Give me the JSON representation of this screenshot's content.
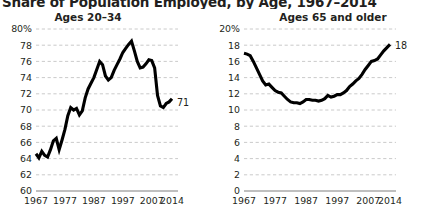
{
  "title": "Share of Population Employed, by Age, 1967–2014",
  "charts": [
    {
      "id": "ages-20-34",
      "title": "Ages 20–34",
      "end_label": "71"
    },
    {
      "id": "ages-65-older",
      "title": "Ages 65 and older",
      "end_label": "18"
    }
  ],
  "chart_data": [
    {
      "type": "line",
      "title": "Ages 20–34",
      "subtitle": "",
      "xlabel": "",
      "ylabel": "",
      "xlim": [
        1967,
        2014
      ],
      "ylim": [
        60,
        80
      ],
      "grid": true,
      "legend": null,
      "xtick_labels": [
        "1967",
        "1977",
        "1987",
        "1997",
        "2007",
        "2014"
      ],
      "xtick_values": [
        1967,
        1977,
        1987,
        1997,
        2007,
        2014
      ],
      "ytick_labels": [
        "60",
        "62",
        "64",
        "66",
        "68",
        "70",
        "72",
        "74",
        "76",
        "78",
        "80%"
      ],
      "ytick_values": [
        60,
        62,
        64,
        66,
        68,
        70,
        72,
        74,
        76,
        78,
        80
      ],
      "annotations": [
        {
          "text": "71",
          "x": 2014,
          "y": 71.0
        }
      ],
      "series": [
        {
          "name": "Ages 20-34",
          "x": [
            1967,
            1968,
            1969,
            1970,
            1971,
            1972,
            1973,
            1974,
            1975,
            1976,
            1977,
            1978,
            1979,
            1980,
            1981,
            1982,
            1983,
            1984,
            1985,
            1986,
            1987,
            1988,
            1989,
            1990,
            1991,
            1992,
            1993,
            1994,
            1995,
            1996,
            1997,
            1998,
            1999,
            2000,
            2001,
            2002,
            2003,
            2004,
            2005,
            2006,
            2007,
            2008,
            2009,
            2010,
            2011,
            2012,
            2013,
            2014
          ],
          "values": [
            64.6,
            64.1,
            64.9,
            64.4,
            64.2,
            65.1,
            66.2,
            66.5,
            65.1,
            66.3,
            67.6,
            69.3,
            70.3,
            70.0,
            70.2,
            69.4,
            69.9,
            71.5,
            72.6,
            73.3,
            74.0,
            75.0,
            76.0,
            75.6,
            74.2,
            73.7,
            74.0,
            74.9,
            75.6,
            76.3,
            77.1,
            77.6,
            78.1,
            78.5,
            77.3,
            76.0,
            75.2,
            75.3,
            75.7,
            76.2,
            76.1,
            75.2,
            71.8,
            70.5,
            70.3,
            70.8,
            71.0,
            71.4
          ]
        }
      ]
    },
    {
      "type": "line",
      "title": "Ages 65 and older",
      "subtitle": "",
      "xlabel": "",
      "ylabel": "",
      "xlim": [
        1967,
        2014
      ],
      "ylim": [
        0,
        20
      ],
      "grid": true,
      "legend": null,
      "xtick_labels": [
        "1967",
        "1977",
        "1987",
        "1997",
        "2007",
        "2014"
      ],
      "xtick_values": [
        1967,
        1977,
        1987,
        1997,
        2007,
        2014
      ],
      "ytick_labels": [
        "0",
        "2",
        "4",
        "6",
        "8",
        "10",
        "12",
        "14",
        "16",
        "18",
        "20%"
      ],
      "ytick_values": [
        0,
        2,
        4,
        6,
        8,
        10,
        12,
        14,
        16,
        18,
        20
      ],
      "annotations": [
        {
          "text": "18",
          "x": 2014,
          "y": 18.0
        }
      ],
      "series": [
        {
          "name": "Ages 65 and older",
          "x": [
            1967,
            1968,
            1969,
            1970,
            1971,
            1972,
            1973,
            1974,
            1975,
            1976,
            1977,
            1978,
            1979,
            1980,
            1981,
            1982,
            1983,
            1984,
            1985,
            1986,
            1987,
            1988,
            1989,
            1990,
            1991,
            1992,
            1993,
            1994,
            1995,
            1996,
            1997,
            1998,
            1999,
            2000,
            2001,
            2002,
            2003,
            2004,
            2005,
            2006,
            2007,
            2008,
            2009,
            2010,
            2011,
            2012,
            2013,
            2014
          ],
          "values": [
            17.0,
            16.9,
            16.7,
            16.0,
            15.2,
            14.4,
            13.6,
            13.1,
            13.2,
            12.8,
            12.4,
            12.2,
            12.1,
            11.7,
            11.3,
            11.0,
            10.9,
            10.9,
            10.8,
            11.0,
            11.3,
            11.3,
            11.2,
            11.2,
            11.1,
            11.2,
            11.4,
            11.8,
            11.6,
            11.7,
            11.9,
            11.9,
            12.1,
            12.4,
            12.9,
            13.2,
            13.6,
            13.9,
            14.4,
            15.0,
            15.5,
            16.0,
            16.1,
            16.3,
            16.8,
            17.3,
            17.7,
            18.1
          ]
        }
      ]
    }
  ]
}
